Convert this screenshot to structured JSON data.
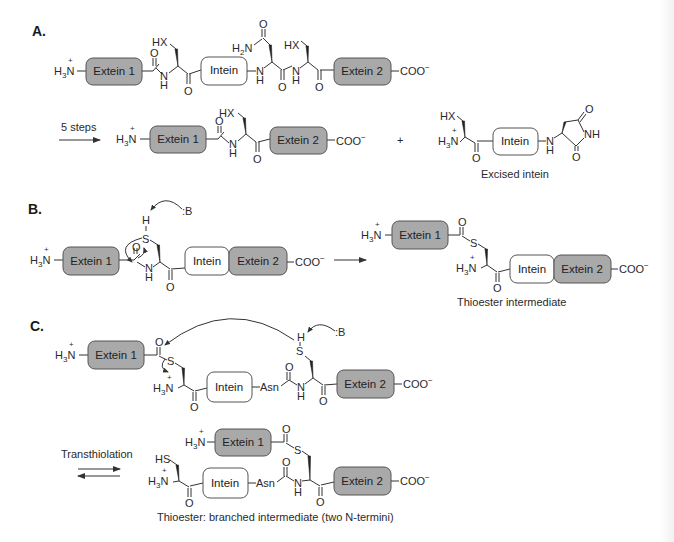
{
  "colors": {
    "extein_fill": "#a9a9a9",
    "intein_fill": "#ffffff",
    "line": "#333333"
  },
  "labels": {
    "extein1": "Extein 1",
    "extein2": "Extein 2",
    "intein": "Intein",
    "coo": "COO",
    "minus": "−",
    "h3n_H": "H",
    "h3n_3": "3",
    "h3n_N": "N",
    "plus": "+",
    "h2n_H": "H",
    "h2n_2": "2",
    "h2n_N": "N",
    "HX": "HX",
    "HS": "HS",
    "S": "S",
    "H": "H",
    "N": "N",
    "NH": "NH",
    "O": "O",
    "B": ":B",
    "Asn": "Asn"
  },
  "panels": {
    "A": {
      "label": "A.",
      "arrow_label": "5 steps",
      "plus_sign": "+",
      "caption": "Excised intein"
    },
    "B": {
      "label": "B.",
      "caption": "Thioester intermediate"
    },
    "C": {
      "label": "C.",
      "arrow_label": "Transthiolation",
      "caption": "Thioester: branched intermediate (two N-termini)"
    }
  }
}
